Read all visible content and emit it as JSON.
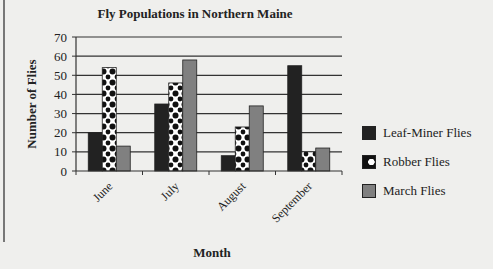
{
  "chart_data": {
    "type": "bar",
    "title": "Fly Populations in Northern Maine",
    "xlabel": "Month",
    "ylabel": "Number of Flies",
    "categories": [
      "June",
      "July",
      "August",
      "September"
    ],
    "series": [
      {
        "name": "Leaf-Miner Flies",
        "values": [
          20,
          35,
          8,
          55
        ],
        "fill": "#222222",
        "pattern": "solid"
      },
      {
        "name": "Robber Flies",
        "values": [
          54,
          46,
          23,
          10
        ],
        "fill": "#ffffff",
        "pattern": "dots"
      },
      {
        "name": "March Flies",
        "values": [
          13,
          58,
          34,
          12
        ],
        "fill": "#808080",
        "pattern": "solid"
      }
    ],
    "ylim": [
      0,
      70
    ],
    "yticks": [
      0,
      10,
      20,
      30,
      40,
      50,
      60,
      70
    ],
    "grid": true,
    "legend_position": "right"
  },
  "legend": {
    "items": [
      "Leaf-Miner Flies",
      "Robber Flies",
      "March Flies"
    ]
  }
}
